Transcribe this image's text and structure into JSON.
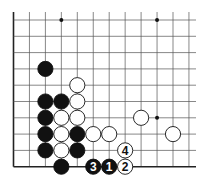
{
  "diagram": {
    "type": "go-board-fragment",
    "columns": 12,
    "rows": 10,
    "open_edges": [
      "top",
      "right"
    ],
    "board_edges": [
      "left",
      "bottom"
    ],
    "star_points": [
      {
        "col": 3,
        "row": 0
      },
      {
        "col": 9,
        "row": 0
      },
      {
        "col": 9,
        "row": 6
      }
    ],
    "stones": [
      {
        "col": 2,
        "row": 3,
        "color": "black"
      },
      {
        "col": 4,
        "row": 4,
        "color": "white"
      },
      {
        "col": 2,
        "row": 5,
        "color": "black"
      },
      {
        "col": 3,
        "row": 5,
        "color": "black"
      },
      {
        "col": 4,
        "row": 5,
        "color": "white"
      },
      {
        "col": 2,
        "row": 6,
        "color": "black"
      },
      {
        "col": 3,
        "row": 6,
        "color": "white"
      },
      {
        "col": 4,
        "row": 6,
        "color": "white"
      },
      {
        "col": 8,
        "row": 6,
        "color": "white"
      },
      {
        "col": 2,
        "row": 7,
        "color": "black"
      },
      {
        "col": 3,
        "row": 7,
        "color": "white"
      },
      {
        "col": 4,
        "row": 7,
        "color": "black"
      },
      {
        "col": 5,
        "row": 7,
        "color": "white"
      },
      {
        "col": 6,
        "row": 7,
        "color": "white"
      },
      {
        "col": 10,
        "row": 7,
        "color": "white"
      },
      {
        "col": 2,
        "row": 8,
        "color": "black"
      },
      {
        "col": 3,
        "row": 8,
        "color": "white"
      },
      {
        "col": 4,
        "row": 8,
        "color": "black"
      },
      {
        "col": 7,
        "row": 8,
        "color": "white",
        "label": "4"
      },
      {
        "col": 3,
        "row": 9,
        "color": "black"
      },
      {
        "col": 5,
        "row": 9,
        "color": "black",
        "label": "3"
      },
      {
        "col": 6,
        "row": 9,
        "color": "black",
        "label": "1"
      },
      {
        "col": 7,
        "row": 9,
        "color": "white",
        "label": "2"
      }
    ],
    "colors": {
      "black_stone": "#111111",
      "white_stone": "#ffffff",
      "grid_line": "#555555",
      "edge_line": "#222222"
    }
  }
}
